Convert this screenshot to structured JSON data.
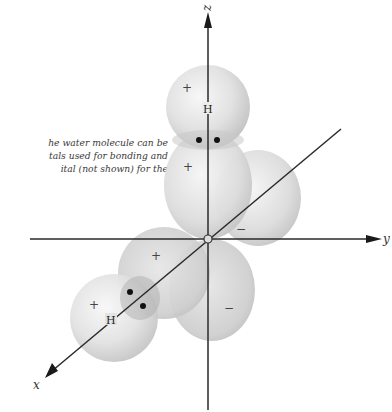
{
  "caption": {
    "lines": [
      "he water molecule can be",
      "tals used for bonding and",
      "ital (not shown) for the"
    ]
  },
  "axes": {
    "z_label": "z",
    "y_label": "y",
    "x_label": "x",
    "color": "#2a2a2a"
  },
  "atoms": {
    "top_h_label": "H",
    "bottom_h_label": "H"
  },
  "signs": {
    "top_h_sign": "+",
    "upper_lobe_sign": "+",
    "right_lobe_sign": "−",
    "front_lobe_sign": "+",
    "bottom_h_sign": "+",
    "lower_lobe_sign": "−"
  },
  "colors": {
    "orbital_light": "#f4f4f4",
    "orbital_mid": "#d8d8d8",
    "orbital_dark": "#bdbdbd",
    "electron": "#111111"
  }
}
